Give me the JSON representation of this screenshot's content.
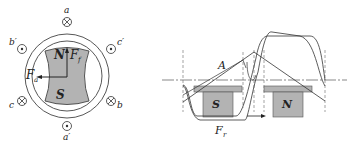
{
  "left_figure": {
    "title": "Stator with salient-pole rotor",
    "coils": {
      "a": "a",
      "a_prime": "a′",
      "b": "b",
      "b_prime": "b′",
      "c": "c",
      "c_prime": "c′"
    },
    "rotor_poles": {
      "north": "N",
      "south": "S"
    },
    "vectors": {
      "field": "F",
      "field_sub": "f",
      "armature": "F",
      "armature_sub": "a"
    },
    "colors": {
      "pole_fill": "#b3b3b3",
      "line": "#333333"
    }
  },
  "right_figure": {
    "title": "Developed air-gap view",
    "poles": {
      "south": "S",
      "north": "N"
    },
    "labels": {
      "A": "A",
      "Fr": "F",
      "Fr_sub": "r"
    },
    "colors": {
      "pole_fill": "#b3b3b3",
      "line": "#333333"
    }
  }
}
